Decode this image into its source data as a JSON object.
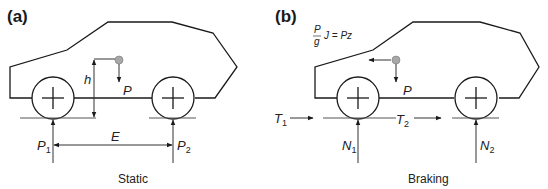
{
  "figure": {
    "panels": [
      {
        "id": "a",
        "label": "(a)",
        "caption": "Static",
        "labels": {
          "height": "h",
          "weight": "P",
          "front_reaction": "P",
          "front_reaction_sub": "1",
          "rear_reaction": "P",
          "rear_reaction_sub": "2",
          "wheelbase": "E"
        }
      },
      {
        "id": "b",
        "label": "(b)",
        "caption": "Braking",
        "labels": {
          "formula_num": "P",
          "formula_den": "g",
          "formula_rest": "J = Pz",
          "weight": "P",
          "front_brake_force": "T",
          "front_brake_force_sub": "1",
          "rear_brake_force": "T",
          "rear_brake_force_sub": "2",
          "front_normal": "N",
          "front_normal_sub": "1",
          "rear_normal": "N",
          "rear_normal_sub": "2"
        }
      }
    ],
    "colors": {
      "outline": "#1a1a1a",
      "cg_dot": "#a8a8a8"
    }
  }
}
